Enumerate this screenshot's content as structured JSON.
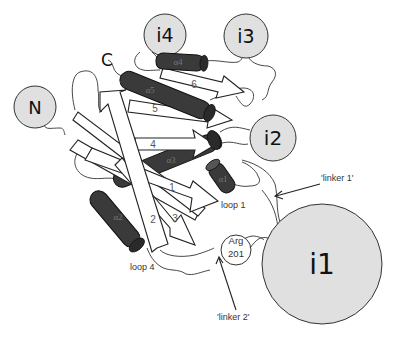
{
  "figure": {
    "domains": [
      {
        "id": "i1",
        "label": "i1"
      },
      {
        "id": "i2",
        "label": "i2"
      },
      {
        "id": "i3",
        "label": "i3"
      },
      {
        "id": "i4",
        "label": "i4"
      },
      {
        "id": "N",
        "label": "N"
      }
    ],
    "termini": {
      "c_label": "C"
    },
    "strands": [
      {
        "id": "s1",
        "label": "1"
      },
      {
        "id": "s2",
        "label": "2"
      },
      {
        "id": "s3",
        "label": "3"
      },
      {
        "id": "s4",
        "label": "4"
      },
      {
        "id": "s5",
        "label": "5"
      },
      {
        "id": "s6",
        "label": "6"
      }
    ],
    "helices": [
      {
        "id": "a1",
        "label": "α1"
      },
      {
        "id": "a2",
        "label": "α2"
      },
      {
        "id": "a3",
        "label": "α3"
      },
      {
        "id": "a4",
        "label": "α4"
      },
      {
        "id": "a5",
        "label": "α5"
      }
    ],
    "annotations": {
      "loop1": "loop 1",
      "loop4": "loop 4",
      "arg_line1": "Arg",
      "arg_line2": "201",
      "linker1": "'linker  1'",
      "linker2": "'linker  2'"
    },
    "colors": {
      "domain_fill": "#e0e0e0",
      "helix_fill": "#3a3a3a",
      "strand_fill": "#ffffff"
    }
  }
}
